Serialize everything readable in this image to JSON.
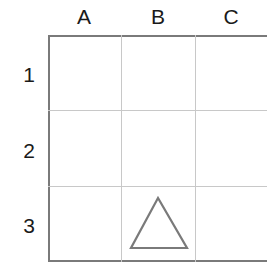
{
  "grid": {
    "columns": [
      "A",
      "B",
      "C"
    ],
    "rows": [
      "1",
      "2",
      "3"
    ],
    "border_color": "#7a7a7a",
    "line_color": "#c8c8c8"
  },
  "shapes": [
    {
      "type": "triangle",
      "cell": "B3",
      "column": "B",
      "row": "3",
      "fill": "none",
      "stroke": "#7a7a7a"
    }
  ]
}
